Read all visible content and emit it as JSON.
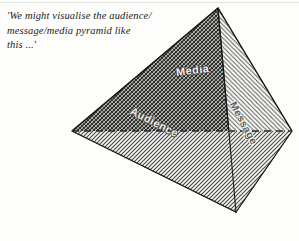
{
  "figure": {
    "caption": "'We might visualise the audience/\nmessage/media pyramid like\nthis ...'",
    "caption_lines": [
      "'We might visualise the audience/",
      "message/media pyramid like",
      "this ...'"
    ],
    "labels": {
      "media": "Media",
      "audience": "Audience",
      "message": "Message"
    },
    "shape": "tetrahedron-pyramid",
    "colors": {
      "page_background": "#fdfdfc",
      "ink": "#232120",
      "outline": "#1c1b1a",
      "face_upper_left_dark": "#6e6e69",
      "face_lower_left_light": "#b9b9b4",
      "face_right_light": "#cfcfca",
      "dashed_edge": "#2a2a28"
    },
    "geometry": {
      "apex": [
        218,
        8
      ],
      "left_vertex": [
        72,
        131
      ],
      "right_vertex": [
        292,
        131
      ],
      "front_vertex": [
        236,
        212
      ],
      "hidden_base_edge_dashed": true
    }
  }
}
